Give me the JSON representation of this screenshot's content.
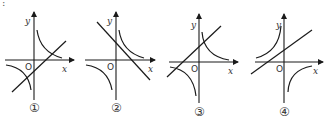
{
  "figure": {
    "prefix_mark": ":",
    "axis_labels": {
      "x": "x",
      "y": "y",
      "origin": "O"
    },
    "graphs": [
      {
        "id": "1",
        "label": "①",
        "hyperbola_quadrants": "I and III",
        "line_slope": "positive",
        "line_intercept": "negative"
      },
      {
        "id": "2",
        "label": "②",
        "hyperbola_quadrants": "I and III",
        "line_slope": "negative",
        "line_intercept": "positive"
      },
      {
        "id": "3",
        "label": "③",
        "hyperbola_quadrants": "I and III",
        "line_slope": "positive",
        "line_intercept": "positive"
      },
      {
        "id": "4",
        "label": "④",
        "hyperbola_quadrants": "II and IV",
        "line_slope": "positive",
        "line_intercept": "positive"
      }
    ]
  }
}
